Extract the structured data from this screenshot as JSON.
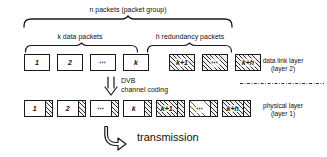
{
  "diagram": {
    "title_top_brace": "n packets (packet group)",
    "brace_left_label": "k data packets",
    "brace_right_label": "h redundancy packets",
    "transition": {
      "line1": "DVB",
      "line2": "channel coding",
      "arrow_icon": "double-down-arrow-icon"
    },
    "transmission": {
      "label": "transmission",
      "arrow_icon": "bent-down-right-arrow-icon"
    },
    "layers": [
      {
        "name_line1": "data link layer",
        "name_line2": "(layer 2)"
      },
      {
        "name_line1": "physical layer",
        "name_line2": "(layer 1)"
      }
    ],
    "link_layer_row": {
      "data_packets": [
        "1",
        "2",
        "⋯",
        "k"
      ],
      "redundancy_packets": [
        "k+1",
        "⋯",
        "k+h"
      ]
    },
    "physical_layer_row": {
      "data_packets": [
        "1",
        "2",
        "⋯",
        "k"
      ],
      "redundancy_packets": [
        "k+1",
        "⋯",
        "k+h"
      ]
    },
    "colors": {
      "stroke": "#1a1a1a",
      "background": "#ffffff",
      "hatch": "#2b2b2b"
    }
  }
}
